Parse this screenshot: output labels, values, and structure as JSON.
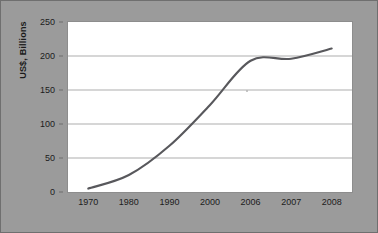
{
  "chart_data": {
    "type": "line",
    "title": "",
    "xlabel": "",
    "ylabel": "US$, Billions",
    "categories": [
      "1970",
      "1980",
      "1990",
      "2000",
      "2006",
      "2007",
      "2008"
    ],
    "values": [
      5,
      25,
      68,
      128,
      193,
      196,
      211
    ],
    "series": [
      {
        "name": "US$, Billions",
        "values": [
          5,
          25,
          68,
          128,
          193,
          196,
          211
        ],
        "color": "#58585c"
      }
    ],
    "ylim": [
      0,
      250
    ],
    "yticks": [
      0,
      50,
      100,
      150,
      200,
      250
    ],
    "ytick_labels": [
      "0",
      "50",
      "100",
      "150",
      "200",
      "250"
    ],
    "grid": true,
    "grid_axis": "y",
    "legend": false,
    "legend_position": "none",
    "smoothed": true,
    "note": "Non-uniform category axis: decade steps 1970-2000 then annual 2006, 2007, 2008"
  },
  "style": {
    "figure_background": "#9b9b9b",
    "plot_background": "#ffffff",
    "border_color": "#6f6f6f",
    "grid_color": "#adadad",
    "line_color": "#58585c",
    "text_color": "#1c1c1c"
  }
}
